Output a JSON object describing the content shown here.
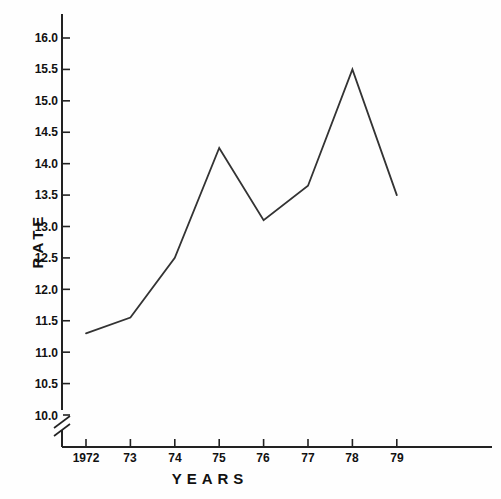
{
  "chart_data": {
    "type": "line",
    "title": "",
    "xlabel": "YEARS",
    "ylabel": "RATE",
    "categories": [
      "1972",
      "73",
      "74",
      "75",
      "76",
      "77",
      "78",
      "79"
    ],
    "x": [
      1972,
      1973,
      1974,
      1975,
      1976,
      1977,
      1978,
      1979
    ],
    "values": [
      11.3,
      11.55,
      12.5,
      14.25,
      13.1,
      13.65,
      15.5,
      13.5
    ],
    "series": [
      {
        "name": "rate",
        "values": [
          11.3,
          11.55,
          12.5,
          14.25,
          13.1,
          13.65,
          15.5,
          13.5
        ]
      }
    ],
    "ytick_labels": [
      "16.0",
      "15.5",
      "15.0",
      "14.5",
      "14.0",
      "13.5",
      "13.0",
      "12.5",
      "12.0",
      "11.5",
      "11.0",
      "10.5",
      "10.0"
    ],
    "ytick_values": [
      16.0,
      15.5,
      15.0,
      14.5,
      14.0,
      13.5,
      13.0,
      12.5,
      12.0,
      11.5,
      11.0,
      10.5,
      10.0
    ],
    "ylim": [
      10.0,
      16.0
    ],
    "xlim": [
      1972,
      1979
    ],
    "grid": false,
    "legend": "none",
    "axis_break": "y-axis-break-below-10.0",
    "line_color": "#333333",
    "axis_color": "#222222",
    "background_color": "#ffffff"
  }
}
